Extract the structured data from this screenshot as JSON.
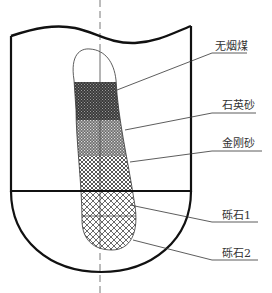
{
  "diagram": {
    "type": "filter-layer-cross-section",
    "colors": {
      "stroke": "#111111",
      "leader": "#333333",
      "text": "#333333",
      "background": "#ffffff"
    },
    "layers": [
      {
        "id": "anthracite",
        "label": "无烟煤",
        "pattern": "dense-dark-dots",
        "label_y": 47,
        "line_y": 53,
        "anchor": [
          117,
          90
        ]
      },
      {
        "id": "quartz-sand",
        "label": "石英砂",
        "label_y": 101,
        "line_y": 113,
        "pattern": "medium-dots",
        "anchor": [
          125,
          130
        ]
      },
      {
        "id": "emery",
        "label": "金刚砂",
        "label_y": 140,
        "line_y": 151,
        "pattern": "fine-cross-hatch",
        "anchor": [
          130,
          162
        ]
      },
      {
        "id": "gravel-1",
        "label": "砾石1",
        "label_y": 209,
        "line_y": 222,
        "pattern": "coarse-cross-hatch",
        "anchor": [
          130,
          205
        ]
      },
      {
        "id": "gravel-2",
        "label": "砾石2",
        "label_y": 247,
        "line_y": 260,
        "pattern": "coarse-cross-hatch",
        "anchor": [
          133,
          240
        ]
      }
    ]
  }
}
